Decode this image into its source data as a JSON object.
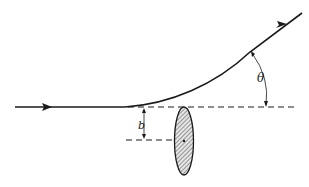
{
  "diagram": {
    "type": "scattering-trajectory",
    "labels": {
      "impact_parameter": "b",
      "scattering_angle": "θ"
    },
    "colors": {
      "stroke": "#1a1a1a",
      "background": "#ffffff",
      "hatch": "#333333",
      "target_fill": "#e6e6e6"
    }
  }
}
